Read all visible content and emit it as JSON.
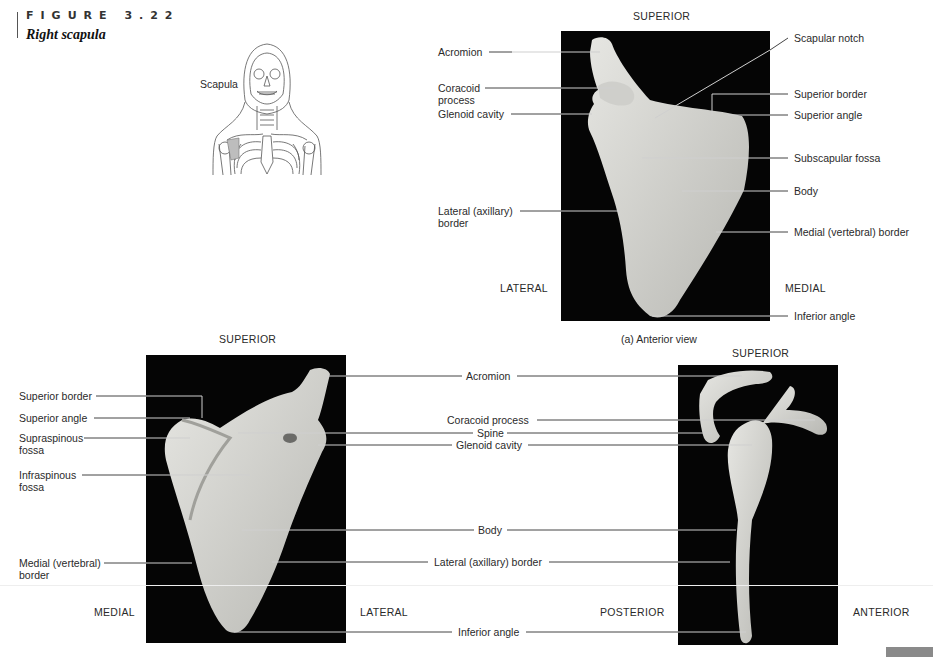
{
  "figure": {
    "number": "FIGURE 3.22",
    "title": "Right scapula"
  },
  "inset": {
    "label": "Scapula",
    "highlight_color": "#bdbdbd"
  },
  "panel_a": {
    "caption": "(a) Anterior view",
    "directions": {
      "top": "SUPERIOR",
      "left": "LATERAL",
      "right": "MEDIAL"
    },
    "labels_left": [
      {
        "text": "Acromion"
      },
      {
        "text": "Coracoid\nprocess"
      },
      {
        "text": "Glenoid cavity"
      },
      {
        "text": "Lateral (axillary)\nborder"
      }
    ],
    "labels_right": [
      {
        "text": "Scapular notch"
      },
      {
        "text": "Superior border"
      },
      {
        "text": "Superior angle"
      },
      {
        "text": "Subscapular fossa"
      },
      {
        "text": "Body"
      },
      {
        "text": "Medial (vertebral) border"
      },
      {
        "text": "Inferior angle"
      }
    ]
  },
  "panel_b": {
    "directions": {
      "top": "SUPERIOR",
      "left": "MEDIAL",
      "right": "LATERAL"
    },
    "labels_left": [
      {
        "text": "Superior border"
      },
      {
        "text": "Superior angle"
      },
      {
        "text": "Supraspinous\nfossa"
      },
      {
        "text": "Infraspinous\nfossa"
      },
      {
        "text": "Medial (vertebral)\nborder"
      }
    ]
  },
  "shared_labels": [
    {
      "text": "Acromion"
    },
    {
      "text": "Coracoid process"
    },
    {
      "text": "Spine"
    },
    {
      "text": "Glenoid cavity"
    },
    {
      "text": "Body"
    },
    {
      "text": "Lateral (axillary) border"
    },
    {
      "text": "Inferior angle"
    }
  ],
  "panel_c": {
    "directions": {
      "top": "SUPERIOR",
      "left": "POSTERIOR",
      "right": "ANTERIOR"
    }
  },
  "colors": {
    "photo_bg": "#050505",
    "bone": "#dcdcd8",
    "bone_shadow": "#a9a9a4",
    "text": "#2a2a2a"
  }
}
